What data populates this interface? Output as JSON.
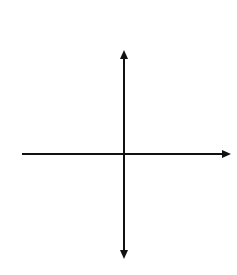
{
  "chart_data": {
    "type": "line",
    "xlabel": "x",
    "ylabel": "y",
    "xlim": [
      -10,
      10
    ],
    "ylim": [
      -10,
      10
    ],
    "grid": true,
    "grid_step": 1,
    "series": [
      {
        "name": "y = 2^x",
        "function": "2^x",
        "x": [
          -10,
          -8,
          -6,
          -4,
          -3,
          -2,
          -1,
          0,
          1,
          2,
          3,
          3.3
        ],
        "values": [
          0.001,
          0.004,
          0.016,
          0.0625,
          0.125,
          0.25,
          0.5,
          1,
          2,
          4,
          8,
          10
        ],
        "color": "#8a8a8a",
        "left_arrow": true
      }
    ],
    "axes_color": "#111111",
    "grid_color": "#c8c8c8"
  }
}
